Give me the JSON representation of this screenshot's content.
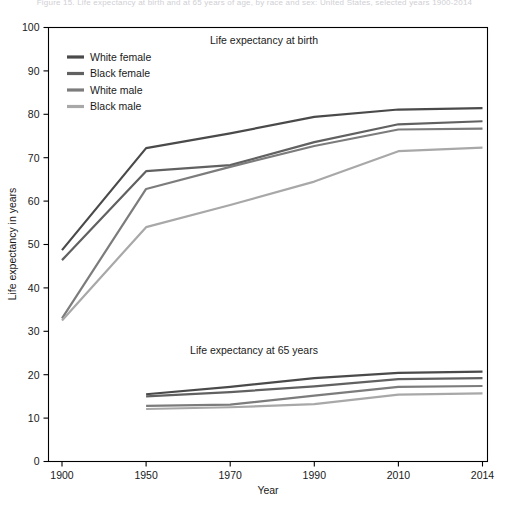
{
  "figure": {
    "top_caption": "Figure 15. Life expectancy at birth and at 65 years of age, by race and sex: United States, selected years 1900-2014",
    "panel_birth_label": "Life expectancy at birth",
    "panel_65_label": "Life expectancy at 65 years"
  },
  "legend": {
    "position": "top-left-inside",
    "items": [
      {
        "label": "White female",
        "color": "#4a4a4a"
      },
      {
        "label": "Black female",
        "color": "#616161"
      },
      {
        "label": "White male",
        "color": "#7c7c7c"
      },
      {
        "label": "Black male",
        "color": "#a8a8a8"
      }
    ]
  },
  "chart_data": {
    "type": "line",
    "title": "Life expectancy at birth and at 65 years of age, by race and sex: United States, selected years 1900-2014",
    "xlabel": "Year",
    "ylabel": "Life expectancy in years",
    "x": [
      "1900",
      "1950",
      "1970",
      "1990",
      "2010",
      "2014"
    ],
    "xticklabels": [
      "1900",
      "1950",
      "1970",
      "1990",
      "2010",
      "2014"
    ],
    "x_scale": "categorical-evenly-spaced",
    "ylim": [
      0,
      100
    ],
    "yticks": [
      0,
      10,
      20,
      30,
      40,
      50,
      60,
      70,
      80,
      90,
      100
    ],
    "grid": false,
    "legend_position": "upper left, inside axes",
    "panels": [
      {
        "name": "Life expectancy at birth",
        "annotation": "Life expectancy at birth",
        "series": [
          {
            "name": "White female",
            "color": "#4a4a4a",
            "x": [
              "1900",
              "1950",
              "1970",
              "1990",
              "2010",
              "2014"
            ],
            "values": [
              48.7,
              72.2,
              75.6,
              79.4,
              81.1,
              81.4
            ]
          },
          {
            "name": "Black female",
            "color": "#616161",
            "x": [
              "1900",
              "1950",
              "1970",
              "1990",
              "2010",
              "2014"
            ],
            "values": [
              46.4,
              66.9,
              68.3,
              73.6,
              77.7,
              78.4
            ]
          },
          {
            "name": "White male",
            "color": "#7c7c7c",
            "x": [
              "1900",
              "1950",
              "1970",
              "1990",
              "2010",
              "2014"
            ],
            "values": [
              33.0,
              62.8,
              67.9,
              72.7,
              76.5,
              76.7
            ]
          },
          {
            "name": "Black male",
            "color": "#a8a8a8",
            "x": [
              "1900",
              "1950",
              "1970",
              "1990",
              "2010",
              "2014"
            ],
            "values": [
              32.5,
              54.0,
              59.1,
              64.5,
              71.5,
              72.3
            ]
          }
        ]
      },
      {
        "name": "Life expectancy at 65 years",
        "annotation": "Life expectancy at 65 years",
        "series": [
          {
            "name": "White female",
            "color": "#4a4a4a",
            "x": [
              "1950",
              "1970",
              "1990",
              "2010",
              "2014"
            ],
            "values": [
              15.5,
              17.2,
              19.2,
              20.4,
              20.7
            ]
          },
          {
            "name": "Black female",
            "color": "#616161",
            "x": [
              "1950",
              "1970",
              "1990",
              "2010",
              "2014"
            ],
            "values": [
              15.0,
              16.0,
              17.3,
              19.0,
              19.2
            ]
          },
          {
            "name": "White male",
            "color": "#7c7c7c",
            "x": [
              "1950",
              "1970",
              "1990",
              "2010",
              "2014"
            ],
            "values": [
              12.8,
              13.1,
              15.2,
              17.2,
              17.4
            ]
          },
          {
            "name": "Black male",
            "color": "#a8a8a8",
            "x": [
              "1950",
              "1970",
              "1990",
              "2010",
              "2014"
            ],
            "values": [
              12.1,
              12.5,
              13.2,
              15.4,
              15.7
            ]
          }
        ]
      }
    ]
  }
}
